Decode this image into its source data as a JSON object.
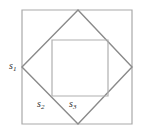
{
  "figure": {
    "type": "geometry-diagram",
    "background_color": "#ffffff",
    "canvas": {
      "width": 144,
      "height": 135
    },
    "shapes": {
      "outer_square": {
        "name": "outer-square",
        "stroke_color": "#a9a9a9",
        "stroke_width": 1.2,
        "fill": "none",
        "x": 22,
        "y": 10,
        "width": 110,
        "height": 114,
        "points": "22,10 132,10 132,124 22,124"
      },
      "diamond": {
        "name": "inscribed-rotated-square",
        "stroke_color": "#8a8a8a",
        "stroke_width": 1.4,
        "fill": "none",
        "points": "78,10 132,67 78,124 22,67",
        "vertices": [
          {
            "label": "top",
            "x": 78,
            "y": 10
          },
          {
            "label": "right",
            "x": 132,
            "y": 67
          },
          {
            "label": "bottom",
            "x": 78,
            "y": 124
          },
          {
            "label": "left",
            "x": 22,
            "y": 67
          }
        ]
      },
      "inner_square": {
        "name": "inner-square",
        "stroke_color": "#b0b0b0",
        "stroke_width": 1.2,
        "fill": "none",
        "x": 52,
        "y": 40,
        "width": 56,
        "height": 56,
        "points": "52,40 108,40 108,96 52,96"
      }
    },
    "labels": [
      {
        "id": "s1",
        "base": "s",
        "subscript": "1",
        "text": "s1",
        "x": 9,
        "y": 61,
        "anchor": "outer-square-left-side",
        "color": "#2b2b2b"
      },
      {
        "id": "s2",
        "base": "s",
        "subscript": "2",
        "text": "s2",
        "x": 37,
        "y": 99,
        "anchor": "diamond-lower-left-edge",
        "color": "#2b2b2b"
      },
      {
        "id": "s3",
        "base": "s",
        "subscript": "3",
        "text": "s3",
        "x": 69,
        "y": 99,
        "anchor": "inner-square-bottom-side",
        "color": "#2b2b2b"
      }
    ]
  }
}
